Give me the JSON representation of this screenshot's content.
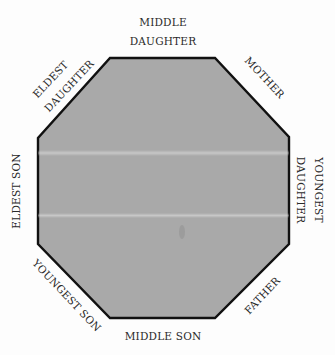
{
  "diagram": {
    "type": "octagon-seating",
    "fill_color": "#a9a9a9",
    "stroke_color": "#111111",
    "background_color": "#fdfdfd",
    "vertices": [
      [
        110,
        58
      ],
      [
        215,
        58
      ],
      [
        289,
        137
      ],
      [
        289,
        244
      ],
      [
        215,
        318
      ],
      [
        110,
        318
      ],
      [
        38,
        244
      ],
      [
        38,
        138
      ]
    ],
    "sides": {
      "top": {
        "line1": "MIDDLE",
        "line2": "DAUGHTER"
      },
      "top_right": {
        "line1": "MOTHER"
      },
      "right": {
        "line1": "YOUNGEST",
        "line2": "DAUGHTER"
      },
      "bottom_right": {
        "line1": "FATHER"
      },
      "bottom": {
        "line1": "MIDDLE SON"
      },
      "bottom_left": {
        "line1": "YOUNGEST SON"
      },
      "left": {
        "line1": "ELDEST SON"
      },
      "top_left": {
        "line1": "ELDEST",
        "line2": "DAUGHTER"
      }
    }
  }
}
